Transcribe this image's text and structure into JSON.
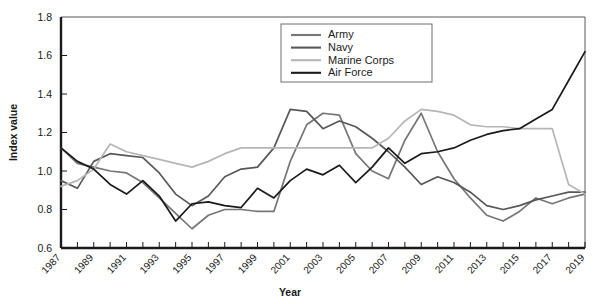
{
  "chart_data": {
    "type": "line",
    "title": "",
    "xlabel": "Year",
    "ylabel": "Index value",
    "xlim": [
      1987,
      2019
    ],
    "ylim": [
      0.6,
      1.8
    ],
    "ytick_labels": [
      "1.8",
      "1.6",
      "1.4",
      "1.2",
      "1.0",
      "0.8",
      "0.6"
    ],
    "ytick_values": [
      1.8,
      1.6,
      1.4,
      1.2,
      1.0,
      0.8,
      0.6
    ],
    "grid": false,
    "legend_position": "top-right",
    "x": [
      1987,
      1988,
      1989,
      1990,
      1991,
      1992,
      1993,
      1994,
      1995,
      1996,
      1997,
      1998,
      1999,
      2000,
      2001,
      2002,
      2003,
      2004,
      2005,
      2006,
      2007,
      2008,
      2009,
      2010,
      2011,
      2012,
      2013,
      2014,
      2015,
      2016,
      2017,
      2018,
      2019
    ],
    "xtick_labels": [
      "1987",
      "1989",
      "1991",
      "1993",
      "1995",
      "1997",
      "1999",
      "2001",
      "2003",
      "2005",
      "2007",
      "2009",
      "2011",
      "2013",
      "2015",
      "2017",
      "2019"
    ],
    "xtick_values": [
      1987,
      1989,
      1991,
      1993,
      1995,
      1997,
      1999,
      2001,
      2003,
      2005,
      2007,
      2009,
      2011,
      2013,
      2015,
      2017,
      2019
    ],
    "series": [
      {
        "name": "Army",
        "color": "#767678",
        "values": [
          1.12,
          1.04,
          1.02,
          1.0,
          0.99,
          0.94,
          0.86,
          0.78,
          0.7,
          0.77,
          0.8,
          0.8,
          0.79,
          0.79,
          1.05,
          1.24,
          1.3,
          1.29,
          1.09,
          1.0,
          0.96,
          1.16,
          1.3,
          1.1,
          0.96,
          0.86,
          0.77,
          0.74,
          0.79,
          0.86,
          0.83,
          0.86,
          0.88
        ]
      },
      {
        "name": "Navy",
        "color": "#58585a",
        "values": [
          0.95,
          0.91,
          1.05,
          1.09,
          1.08,
          1.07,
          0.99,
          0.88,
          0.82,
          0.87,
          0.97,
          1.01,
          1.02,
          1.12,
          1.32,
          1.31,
          1.22,
          1.26,
          1.23,
          1.17,
          1.1,
          1.02,
          0.93,
          0.97,
          0.94,
          0.89,
          0.82,
          0.8,
          0.82,
          0.85,
          0.87,
          0.89,
          0.89
        ]
      },
      {
        "name": "Marine Corps",
        "color": "#b6b6b8",
        "values": [
          0.92,
          0.95,
          1.01,
          1.14,
          1.1,
          1.08,
          1.06,
          1.04,
          1.02,
          1.05,
          1.09,
          1.12,
          1.12,
          1.12,
          1.12,
          1.12,
          1.12,
          1.12,
          1.12,
          1.12,
          1.17,
          1.26,
          1.32,
          1.31,
          1.29,
          1.24,
          1.23,
          1.23,
          1.22,
          1.22,
          1.22,
          0.93,
          0.88
        ]
      },
      {
        "name": "Air Force",
        "color": "#1a1a1a",
        "values": [
          1.12,
          1.05,
          1.01,
          0.93,
          0.88,
          0.95,
          0.87,
          0.74,
          0.83,
          0.84,
          0.82,
          0.81,
          0.91,
          0.86,
          0.95,
          1.01,
          0.98,
          1.03,
          0.94,
          1.02,
          1.12,
          1.04,
          1.09,
          1.1,
          1.12,
          1.16,
          1.19,
          1.21,
          1.22,
          1.27,
          1.32,
          1.47,
          1.62
        ]
      }
    ]
  },
  "legend": {
    "items": [
      {
        "label": "Army"
      },
      {
        "label": "Navy"
      },
      {
        "label": "Marine Corps"
      },
      {
        "label": "Air Force"
      }
    ]
  },
  "axes": {
    "x_title": "Year",
    "y_title": "Index value"
  }
}
